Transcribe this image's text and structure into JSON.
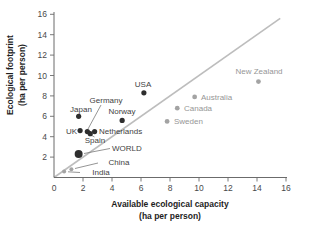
{
  "figure": {
    "width": 315,
    "height": 231,
    "background": "#ffffff"
  },
  "chart_data": {
    "type": "scatter",
    "title": "",
    "xlabel_line1": "Available ecological capacity",
    "xlabel_line2": "(ha per person)",
    "ylabel_line1": "Ecological footprint",
    "ylabel_line2": "(ha per person)",
    "xlim": [
      0,
      16
    ],
    "ylim": [
      0,
      16
    ],
    "xticks": [
      0,
      2,
      4,
      6,
      8,
      10,
      12,
      14,
      16
    ],
    "yticks": [
      2,
      4,
      6,
      8,
      10,
      12,
      14,
      16
    ],
    "grid": false,
    "legend": "none",
    "reference_line": {
      "kind": "y-equals-x",
      "from": [
        0,
        0
      ],
      "to": [
        15.6,
        15.6
      ]
    },
    "colors": {
      "dark_dot": "#2e2e2e",
      "gray_dot": "#a3a3a3",
      "dark_label": "#3f3f3f",
      "gray_label": "#969696",
      "axis": "#6b6b6b",
      "tick_label": "#4a4a4a",
      "axis_title": "#1e1e1e",
      "leader": "#7a7a7a",
      "reference": "#bdbdbd"
    },
    "pixel_map": {
      "x0": 54,
      "y0": 177.5,
      "sx": 14.5,
      "sy": 10.2
    },
    "points": [
      {
        "name": "India",
        "x": 0.7,
        "y": 0.6,
        "r": 2,
        "dot": "gray",
        "label_color": "dark",
        "label": {
          "x": 101,
          "y": 175,
          "anchor": "middle"
        },
        "leader": [
          80,
          172.5,
          68,
          171.8
        ]
      },
      {
        "name": "China",
        "x": 1.2,
        "y": 0.8,
        "r": 2,
        "dot": "gray",
        "label_color": "dark",
        "label": {
          "x": 119,
          "y": 165,
          "anchor": "middle"
        },
        "leader": [
          98,
          163,
          75,
          168.5
        ]
      },
      {
        "name": "WORLD",
        "x": 1.7,
        "y": 2.3,
        "r": 4,
        "dot": "dark",
        "label_color": "dark",
        "label": {
          "x": 112,
          "y": 151,
          "anchor": "start"
        },
        "leader": [
          110,
          148.5,
          84,
          153.5
        ]
      },
      {
        "name": "Japan",
        "x": 1.7,
        "y": 6.0,
        "r": 2.6,
        "dot": "dark",
        "label_color": "dark",
        "label": {
          "x": 81,
          "y": 112,
          "anchor": "middle"
        },
        "leader": null
      },
      {
        "name": "UK",
        "x": 1.8,
        "y": 4.6,
        "r": 2.6,
        "dot": "dark",
        "label_color": "dark",
        "label": {
          "x": 77,
          "y": 134,
          "anchor": "end"
        },
        "leader": null
      },
      {
        "name": "Germany",
        "x": 2.3,
        "y": 4.5,
        "r": 2.6,
        "dot": "dark",
        "label_color": "dark",
        "label": {
          "x": 106,
          "y": 103,
          "anchor": "middle"
        },
        "leader": [
          101,
          105,
          88,
          129
        ]
      },
      {
        "name": "Spain",
        "x": 2.5,
        "y": 4.3,
        "r": 2.6,
        "dot": "dark",
        "label_color": "dark",
        "label": {
          "x": 95,
          "y": 143,
          "anchor": "middle"
        },
        "leader": [
          94.5,
          137,
          91.5,
          135.3
        ]
      },
      {
        "name": "Netherlands",
        "x": 2.8,
        "y": 4.5,
        "r": 2.6,
        "dot": "dark",
        "label_color": "dark",
        "label": {
          "x": 99,
          "y": 134,
          "anchor": "start"
        },
        "leader": null
      },
      {
        "name": "Norway",
        "x": 4.7,
        "y": 5.6,
        "r": 2.6,
        "dot": "dark",
        "label_color": "dark",
        "label": {
          "x": 122,
          "y": 114,
          "anchor": "middle"
        },
        "leader": null
      },
      {
        "name": "USA",
        "x": 6.2,
        "y": 8.3,
        "r": 2.6,
        "dot": "dark",
        "label_color": "dark",
        "label": {
          "x": 143,
          "y": 87,
          "anchor": "middle"
        },
        "leader": null
      },
      {
        "name": "Sweden",
        "x": 7.8,
        "y": 5.5,
        "r": 2.4,
        "dot": "gray",
        "label_color": "gray",
        "label": {
          "x": 174,
          "y": 124,
          "anchor": "start"
        },
        "leader": null
      },
      {
        "name": "Canada",
        "x": 8.5,
        "y": 6.8,
        "r": 2.4,
        "dot": "gray",
        "label_color": "gray",
        "label": {
          "x": 184,
          "y": 111,
          "anchor": "start"
        },
        "leader": null
      },
      {
        "name": "Australia",
        "x": 9.7,
        "y": 7.9,
        "r": 2.4,
        "dot": "gray",
        "label_color": "gray",
        "label": {
          "x": 201,
          "y": 100,
          "anchor": "start"
        },
        "leader": null
      },
      {
        "name": "New Zealand",
        "x": 14.1,
        "y": 9.4,
        "r": 2.4,
        "dot": "gray",
        "label_color": "gray",
        "label": {
          "x": 259,
          "y": 74,
          "anchor": "middle"
        },
        "leader": null
      }
    ]
  }
}
